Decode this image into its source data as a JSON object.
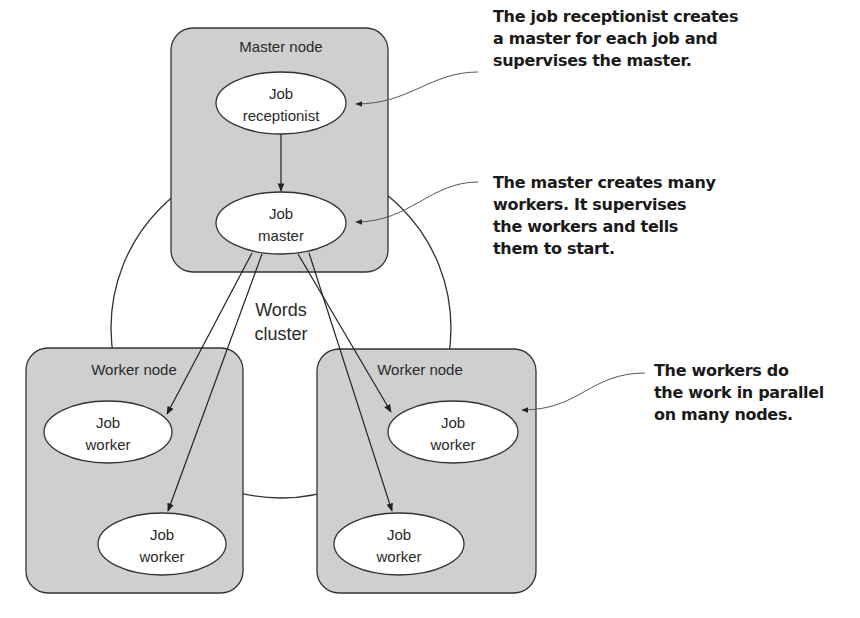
{
  "diagram": {
    "cluster": {
      "label_line1": "Words",
      "label_line2": "cluster"
    },
    "master_node": {
      "label": "Master node",
      "receptionist": {
        "line1": "Job",
        "line2": "receptionist"
      },
      "master": {
        "line1": "Job",
        "line2": "master"
      }
    },
    "worker_node_left": {
      "label": "Worker node",
      "worker_1": {
        "line1": "Job",
        "line2": "worker"
      },
      "worker_2": {
        "line1": "Job",
        "line2": "worker"
      }
    },
    "worker_node_right": {
      "label": "Worker node",
      "worker_1": {
        "line1": "Job",
        "line2": "worker"
      },
      "worker_2": {
        "line1": "Job",
        "line2": "worker"
      }
    },
    "callouts": [
      {
        "lines": [
          "The job receptionist creates",
          "a master for each job and",
          "supervises the master."
        ]
      },
      {
        "lines": [
          "The master creates many",
          "workers. It supervises",
          "the workers and tells",
          "them to start."
        ]
      },
      {
        "lines": [
          "The workers do",
          "the work in parallel",
          "on many nodes."
        ]
      }
    ],
    "colors": {
      "node_fill": "#cfcfcf",
      "stroke": "#333333",
      "ellipse_fill": "#ffffff"
    }
  }
}
